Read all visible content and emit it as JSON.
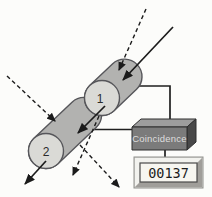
{
  "diagram": {
    "name": "coincidence-detection-diagram",
    "detector1": {
      "label": "1"
    },
    "detector2": {
      "label": "2"
    },
    "coincidence_unit": {
      "label": "Coincidence"
    },
    "counter": {
      "value": "00137"
    }
  },
  "colors": {
    "background": "#fcfcfa",
    "cylinder_body": "#b2b2b0",
    "cylinder_face": "#dadad6",
    "detector_label": "#2a2a2a",
    "box_front": "#7b7b7b",
    "box_top": "#9d9d9d",
    "box_side": "#484848",
    "box_label": "#dedede",
    "counter_frame": "#d4d4d0",
    "counter_frame_highlight": "#f2f2ee",
    "counter_frame_shadow": "#a09e9a",
    "counter_screen": "#f7f6f0",
    "counter_text": "#1c1c1c",
    "line": "#1b1b1b"
  }
}
